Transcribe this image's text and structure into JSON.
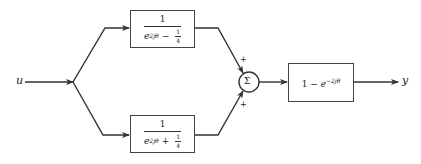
{
  "diagram": {
    "type": "block-diagram",
    "input_label": "u",
    "output_label": "y",
    "blocks": [
      {
        "id": "top-block",
        "numerator": "1",
        "denominator_base": "e",
        "denominator_exponent": "2jθ",
        "denominator_op": "−",
        "denominator_frac_num": "1",
        "denominator_frac_den": "4"
      },
      {
        "id": "bottom-block",
        "numerator": "1",
        "denominator_base": "e",
        "denominator_exponent": "2jθ",
        "denominator_op": "+",
        "denominator_frac_num": "1",
        "denominator_frac_den": "4"
      },
      {
        "id": "output-block",
        "prefix": "1 − ",
        "base": "e",
        "exponent": "−2jθ"
      }
    ],
    "summing_junction": {
      "symbol": "Σ",
      "input_signs": [
        "+",
        "+"
      ]
    },
    "colors": {
      "line": "#333333",
      "background": "#ffffff"
    }
  }
}
